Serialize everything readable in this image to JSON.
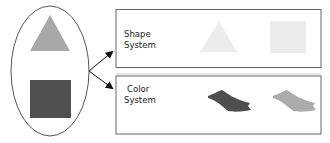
{
  "diagram": {
    "source": {
      "shapes": [
        {
          "kind": "triangle",
          "color": "#a8a8a8"
        },
        {
          "kind": "square",
          "color": "#505050"
        }
      ]
    },
    "boxes": [
      {
        "label_line1": "Shape",
        "label_line2": "System",
        "items": [
          {
            "kind": "triangle",
            "color": "#ececec"
          },
          {
            "kind": "square",
            "color": "#ececec"
          }
        ]
      },
      {
        "label_line1": "Color",
        "label_line2": "System",
        "items": [
          {
            "kind": "brush-stroke",
            "color": "#4e4e4e"
          },
          {
            "kind": "brush-stroke",
            "color": "#ababab"
          }
        ]
      }
    ]
  }
}
